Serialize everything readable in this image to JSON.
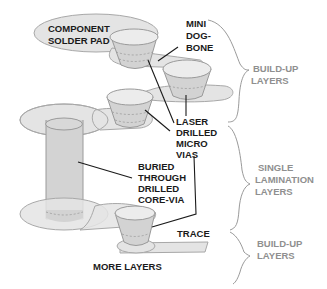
{
  "diagram": {
    "labels": {
      "component_solder_pad": [
        "COMPONENT",
        "SOLDER PAD"
      ],
      "mini_dogbone": [
        "MINI",
        "DOG-",
        "BONE"
      ],
      "laser_drilled_micro_vias": [
        "LASER",
        "DRILLED",
        "MICRO",
        "VIAS"
      ],
      "buried_core_via": [
        "BURIED",
        "THROUGH",
        "DRILLED",
        "CORE-VIA"
      ],
      "trace": "TRACE",
      "more_layers": "MORE LAYERS"
    },
    "groups": [
      {
        "name": "top-build-up",
        "lines": [
          "BUILD-UP",
          "LAYERS"
        ]
      },
      {
        "name": "single-lamination",
        "lines": [
          "SINGLE",
          "LAMINATION",
          "LAYERS"
        ]
      },
      {
        "name": "bottom-build-up",
        "lines": [
          "BUILD-UP",
          "LAYERS"
        ]
      }
    ],
    "colors": {
      "pad_fill": "#e4e4e4",
      "via_fill": "#d3d3d3",
      "outline": "#9a9a9a",
      "label_text": "#1a1a1a",
      "group_text": "#8f8f8f"
    }
  }
}
